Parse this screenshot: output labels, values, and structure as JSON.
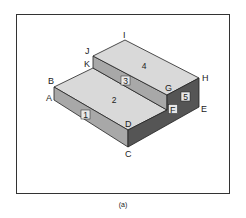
{
  "figure": {
    "caption": "(a)",
    "vertices": {
      "A": "A",
      "B": "B",
      "C": "C",
      "D": "D",
      "E": "E",
      "F": "F",
      "G": "G",
      "H": "H",
      "I": "I",
      "J": "J",
      "K": "K"
    },
    "faces": {
      "f1": "1",
      "f2": "2",
      "f3": "3",
      "f4": "4",
      "f5": "5"
    },
    "colors": {
      "top_face": "#d9d9d9",
      "front_riser": "#a8a8a8",
      "side_face": "#555555",
      "edge": "#222222",
      "frame": "#333333"
    }
  }
}
